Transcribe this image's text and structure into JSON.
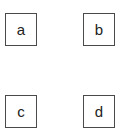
{
  "diagram": {
    "boxes": [
      {
        "label": "a",
        "position": "top-left"
      },
      {
        "label": "b",
        "position": "top-right"
      },
      {
        "label": "c",
        "position": "bottom-left"
      },
      {
        "label": "d",
        "position": "bottom-right"
      }
    ],
    "colors": {
      "border": "#4a4a4a",
      "text": "#222222",
      "background": "#ffffff"
    }
  }
}
